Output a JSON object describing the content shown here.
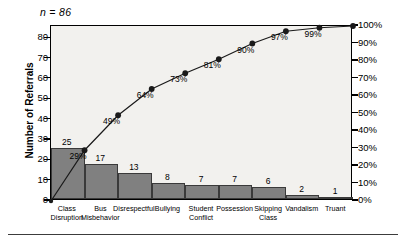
{
  "chart_data": {
    "type": "bar",
    "title": "",
    "subtitle": "",
    "annotation": "n = 86",
    "xlabel": "",
    "ylabel": "Number of Referrals",
    "y2label": "",
    "ylim": [
      0,
      86
    ],
    "y2lim": [
      0,
      100
    ],
    "grid": false,
    "legend": "none",
    "categories": [
      "Class Disruption",
      "Bus Misbehavior",
      "Disrespectful",
      "Bullying",
      "Student Conflict",
      "Possession",
      "Skipping Class",
      "Vandalism",
      "Truant"
    ],
    "values": [
      25,
      17,
      13,
      8,
      7,
      7,
      6,
      2,
      1
    ],
    "value_labels": [
      "25",
      "17",
      "13",
      "8",
      "7",
      "7",
      "6",
      "2",
      "1"
    ],
    "cumulative_percent": [
      29,
      49,
      64,
      73,
      81,
      90,
      97,
      99,
      100
    ],
    "cumulative_labels": [
      "29%",
      "49%",
      "64%",
      "73%",
      "81%",
      "90%",
      "97%",
      "99%",
      "100%"
    ],
    "yticks": [
      0,
      10,
      20,
      30,
      40,
      50,
      60,
      70,
      80
    ],
    "ytick_labels": [
      "0",
      "10",
      "20",
      "30",
      "40",
      "50",
      "60",
      "70",
      "80"
    ],
    "y2ticks": [
      0,
      10,
      20,
      30,
      40,
      50,
      60,
      70,
      80,
      90,
      100
    ],
    "y2tick_labels": [
      "0%",
      "10%",
      "20%",
      "30%",
      "40%",
      "50%",
      "60%",
      "70%",
      "80%",
      "90%",
      "100%"
    ],
    "bar_color": "#808080",
    "bar_edge_color": "#3a3a3a",
    "line_color": "#1a1a1a",
    "marker_color": "#1a1a1a",
    "plot_background": "#f2f1ee",
    "axis_color": "#000000"
  }
}
